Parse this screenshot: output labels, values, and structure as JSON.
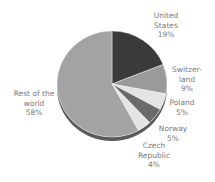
{
  "chart_data": {
    "type": "pie",
    "title": "",
    "style": "3d-pie",
    "start_angle_deg": 0,
    "direction": "clockwise",
    "categories": [
      "United States",
      "Switzerland",
      "Poland",
      "Norway",
      "Czech Republic",
      "Rest of the world"
    ],
    "values": [
      19,
      9,
      5,
      5,
      4,
      58
    ],
    "unit": "%",
    "colors": [
      "#3a3a3a",
      "#9a9a9a",
      "#e4e4e4",
      "#6a6a6a",
      "#e4e4e4",
      "#a3a3a3"
    ],
    "side_color": "#5a5a5a",
    "legend": "none",
    "labels": [
      {
        "lines": [
          "United",
          "States",
          "19%"
        ],
        "x": 166,
        "y": 11
      },
      {
        "lines": [
          "Switzer-",
          "land",
          "9%"
        ],
        "x": 187,
        "y": 65
      },
      {
        "lines": [
          "Poland",
          "5%"
        ],
        "x": 182,
        "y": 98
      },
      {
        "lines": [
          "Norway",
          "5%"
        ],
        "x": 173,
        "y": 124
      },
      {
        "lines": [
          "Czech",
          "Republic",
          "4%"
        ],
        "x": 154,
        "y": 141
      },
      {
        "lines": [
          "Rest of the",
          "world",
          "58%"
        ],
        "x": 34,
        "y": 89
      }
    ]
  },
  "geometry": {
    "cx": 112,
    "cy": 84,
    "rx": 55,
    "ry": 53,
    "depth": 4
  }
}
